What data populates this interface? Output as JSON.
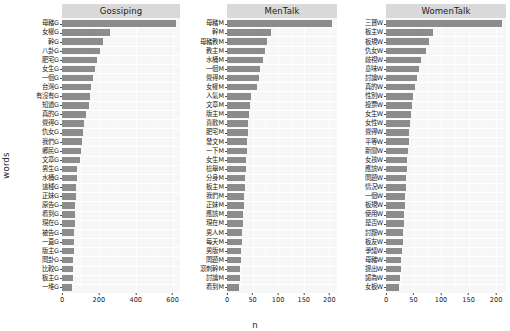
{
  "chart_data": {
    "type": "bar",
    "title": "",
    "xlabel": "n",
    "ylabel": "words",
    "orientation": "horizontal",
    "grid": true,
    "legend": "none",
    "bar_color": "#8c8c8c",
    "panel_background": "#f7f7f7",
    "strip_background": "#d9d9d9",
    "facets": [
      {
        "label": "Gossiping",
        "xlim": [
          0,
          640
        ],
        "xticks": [
          0,
          200,
          400,
          600
        ],
        "categories": [
          "母豬G",
          "女權G",
          "幹G",
          "八卦G",
          "肥宅G",
          "女生G",
          "一個G",
          "台灣G",
          "有沒有G",
          "知道G",
          "真的G",
          "覺得G",
          "仇女G",
          "我們G",
          "鄉民G",
          "文章G",
          "男生G",
          "水桶G",
          "這種G",
          "正妹G",
          "原告G",
          "看到G",
          "現在G",
          "被告G",
          "一直G",
          "版主G",
          "問卦G",
          "比較G",
          "板主G",
          "一堆G"
        ],
        "values": [
          620,
          262,
          222,
          205,
          192,
          181,
          166,
          155,
          150,
          145,
          128,
          120,
          113,
          110,
          105,
          100,
          82,
          79,
          76,
          74,
          72,
          70,
          69,
          67,
          65,
          63,
          61,
          59,
          57,
          55
        ]
      },
      {
        "label": "MenTalk",
        "xlim": [
          0,
          215
        ],
        "xticks": [
          0,
          50,
          100,
          150,
          200
        ],
        "categories": [
          "母豬M",
          "幹M",
          "母豬教M",
          "教主M",
          "水桶M",
          "一個M",
          "覺得M",
          "女權M",
          "人氣M",
          "文章M",
          "版主M",
          "喜歡M",
          "肥宅M",
          "發文M",
          "一下M",
          "女生M",
          "檢舉M",
          "分身M",
          "板主M",
          "我們M",
          "正妹M",
          "應該M",
          "現在M",
          "男人M",
          "每天M",
          "男版M",
          "問題M",
          "滾刺幹M",
          "討論M",
          "看到M"
        ],
        "values": [
          205,
          86,
          78,
          74,
          70,
          65,
          62,
          59,
          46,
          44,
          43,
          42,
          41,
          40,
          39,
          38,
          37,
          36,
          35,
          34,
          33,
          32,
          31,
          30,
          29,
          28,
          27,
          26,
          25,
          24
        ]
      },
      {
        "label": "WomenTalk",
        "xlim": [
          0,
          218
        ],
        "xticks": [
          0,
          50,
          100,
          150,
          200
        ],
        "categories": [
          "三寶W",
          "板主W",
          "板規W",
          "仇女W",
          "歧視W",
          "意味W",
          "討論W",
          "真的W",
          "性別W",
          "投票W",
          "女生W",
          "女性W",
          "覺得W",
          "平等W",
          "新聞W",
          "女孩W",
          "應該W",
          "問題W",
          "情況W",
          "一個W",
          "板規W",
          "使用W",
          "是否W",
          "討厭W",
          "板友W",
          "爭議W",
          "母豬W",
          "提出W",
          "認為W",
          "女板W"
        ],
        "values": [
          210,
          85,
          78,
          72,
          63,
          60,
          57,
          52,
          49,
          47,
          45,
          43,
          42,
          41,
          40,
          39,
          38,
          37,
          36,
          35,
          34,
          33,
          32,
          31,
          30,
          29,
          28,
          27,
          25,
          23
        ]
      }
    ]
  }
}
